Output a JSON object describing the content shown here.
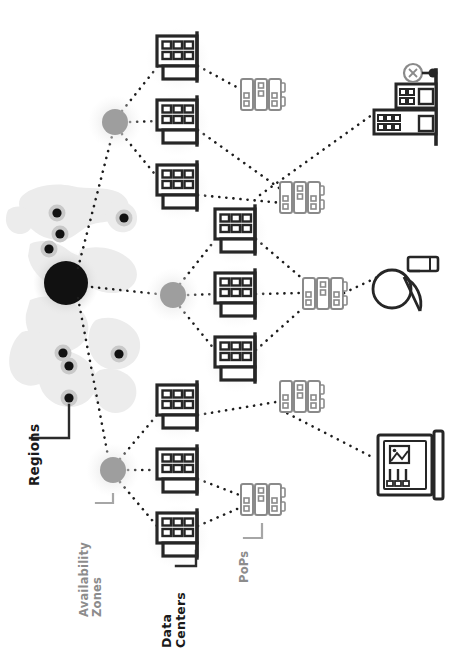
{
  "diagram": {
    "orientation": "rotated-90-ccw",
    "labels": {
      "regions": "Regions",
      "availability_zones_line1": "Availability",
      "availability_zones_line2": "Zones",
      "data_centers_line1": "Data",
      "data_centers_line2": "Centers",
      "pops": "PoPs"
    },
    "colors": {
      "ink": "#1a1a1a",
      "gray_text": "#8c8c8c",
      "az_fill": "#9e9e9e",
      "az_halo": "#efefef",
      "map_land": "#ececec",
      "region_dot": "#111111",
      "region_halo": "#c9c9c9",
      "pop_stroke": "#8a8a8a",
      "dc_stroke": "#262626",
      "dotted_line": "#1d1d1d",
      "leader_dark": "#2b2b2b",
      "leader_gray": "#a6a6a6"
    },
    "map": {
      "caption": "World map with region markers",
      "primary_region": {
        "cx": 66,
        "cy": 283,
        "r": 22,
        "halo_r": 33
      },
      "region_dots": [
        {
          "cx": 57,
          "cy": 213,
          "r": 6
        },
        {
          "cx": 60,
          "cy": 234,
          "r": 6
        },
        {
          "cx": 49,
          "cy": 249,
          "r": 6
        },
        {
          "cx": 124,
          "cy": 218,
          "r": 6
        },
        {
          "cx": 119,
          "cy": 354,
          "r": 6
        },
        {
          "cx": 63,
          "cy": 353,
          "r": 6
        },
        {
          "cx": 69,
          "cy": 366,
          "r": 6
        },
        {
          "cx": 69,
          "cy": 398,
          "r": 6
        }
      ]
    },
    "availability_zones": [
      {
        "id": "az-top",
        "cx": 115,
        "cy": 122,
        "r": 13,
        "halo_r": 26
      },
      {
        "id": "az-middle",
        "cx": 173,
        "cy": 295,
        "r": 13,
        "halo_r": 26
      },
      {
        "id": "az-bottom",
        "cx": 113,
        "cy": 470,
        "r": 13,
        "halo_r": 26
      }
    ],
    "data_centers": [
      {
        "id": "dc-1",
        "zone": "az-top",
        "cx": 180,
        "cy": 57
      },
      {
        "id": "dc-2",
        "zone": "az-top",
        "cx": 180,
        "cy": 121
      },
      {
        "id": "dc-3",
        "zone": "az-top",
        "cx": 180,
        "cy": 186
      },
      {
        "id": "dc-4",
        "zone": "az-middle",
        "cx": 238,
        "cy": 230
      },
      {
        "id": "dc-5",
        "zone": "az-middle",
        "cx": 238,
        "cy": 294
      },
      {
        "id": "dc-6",
        "zone": "az-middle",
        "cx": 238,
        "cy": 358
      },
      {
        "id": "dc-7",
        "zone": "az-bottom",
        "cx": 180,
        "cy": 406
      },
      {
        "id": "dc-8",
        "zone": "az-bottom",
        "cx": 180,
        "cy": 470
      },
      {
        "id": "dc-9",
        "zone": "az-bottom",
        "cx": 180,
        "cy": 534
      }
    ],
    "pops": [
      {
        "id": "pop-1",
        "cx": 262,
        "cy": 94
      },
      {
        "id": "pop-2",
        "cx": 301,
        "cy": 197
      },
      {
        "id": "pop-3",
        "cx": 324,
        "cy": 293
      },
      {
        "id": "pop-4",
        "cx": 301,
        "cy": 396
      },
      {
        "id": "pop-5",
        "cx": 262,
        "cy": 499
      }
    ],
    "endpoints": [
      {
        "id": "endpoint-city",
        "icon": "office-building-icon",
        "cx": 408,
        "cy": 105
      },
      {
        "id": "endpoint-satellite",
        "icon": "satellite-dish-icon",
        "cx": 408,
        "cy": 285
      },
      {
        "id": "endpoint-billboard",
        "icon": "billboard-icon",
        "cx": 408,
        "cy": 463
      }
    ],
    "links": [
      {
        "from": "region-primary",
        "to": "az-top"
      },
      {
        "from": "region-primary",
        "to": "az-middle"
      },
      {
        "from": "region-primary",
        "to": "az-bottom"
      },
      {
        "from": "az-top",
        "to": "dc-1"
      },
      {
        "from": "az-top",
        "to": "dc-2"
      },
      {
        "from": "az-top",
        "to": "dc-3"
      },
      {
        "from": "az-middle",
        "to": "dc-4"
      },
      {
        "from": "az-middle",
        "to": "dc-5"
      },
      {
        "from": "az-middle",
        "to": "dc-6"
      },
      {
        "from": "az-bottom",
        "to": "dc-7"
      },
      {
        "from": "az-bottom",
        "to": "dc-8"
      },
      {
        "from": "az-bottom",
        "to": "dc-9"
      },
      {
        "from": "dc-1",
        "to": "pop-1"
      },
      {
        "from": "dc-2",
        "to": "pop-2"
      },
      {
        "from": "dc-3",
        "to": "pop-2"
      },
      {
        "from": "dc-4",
        "to": "pop-3"
      },
      {
        "from": "dc-5",
        "to": "pop-3"
      },
      {
        "from": "dc-6",
        "to": "pop-3"
      },
      {
        "from": "dc-7",
        "to": "pop-4"
      },
      {
        "from": "dc-8",
        "to": "pop-5"
      },
      {
        "from": "dc-9",
        "to": "pop-5"
      },
      {
        "from": "pop-2",
        "to": "endpoint-city"
      },
      {
        "from": "pop-3",
        "to": "endpoint-satellite"
      },
      {
        "from": "pop-4",
        "to": "endpoint-billboard"
      }
    ]
  }
}
